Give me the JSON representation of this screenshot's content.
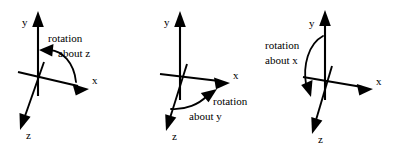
{
  "figure": {
    "background_color": "#ffffff",
    "stroke_color": "#000000"
  },
  "panels": [
    {
      "id": "panel-rotation-about-z",
      "axes": [
        {
          "name": "y",
          "label": "y"
        },
        {
          "name": "x",
          "label": "x"
        },
        {
          "name": "z",
          "label": "z"
        }
      ],
      "annotation": {
        "line1": "rotation",
        "line2": "about z",
        "rotation_axis": "z",
        "arrow_direction": "counterclockwise"
      }
    },
    {
      "id": "panel-rotation-about-y",
      "axes": [
        {
          "name": "y",
          "label": "y"
        },
        {
          "name": "x",
          "label": "x"
        },
        {
          "name": "z",
          "label": "z"
        }
      ],
      "annotation": {
        "line1": "rotation",
        "line2": "about y",
        "rotation_axis": "y",
        "arrow_direction": "counterclockwise"
      }
    },
    {
      "id": "panel-rotation-about-x",
      "axes": [
        {
          "name": "y",
          "label": "y"
        },
        {
          "name": "x",
          "label": "x"
        },
        {
          "name": "z",
          "label": "z"
        }
      ],
      "annotation": {
        "line1": "rotation",
        "line2": "about x",
        "rotation_axis": "x",
        "arrow_direction": "clockwise"
      }
    }
  ]
}
